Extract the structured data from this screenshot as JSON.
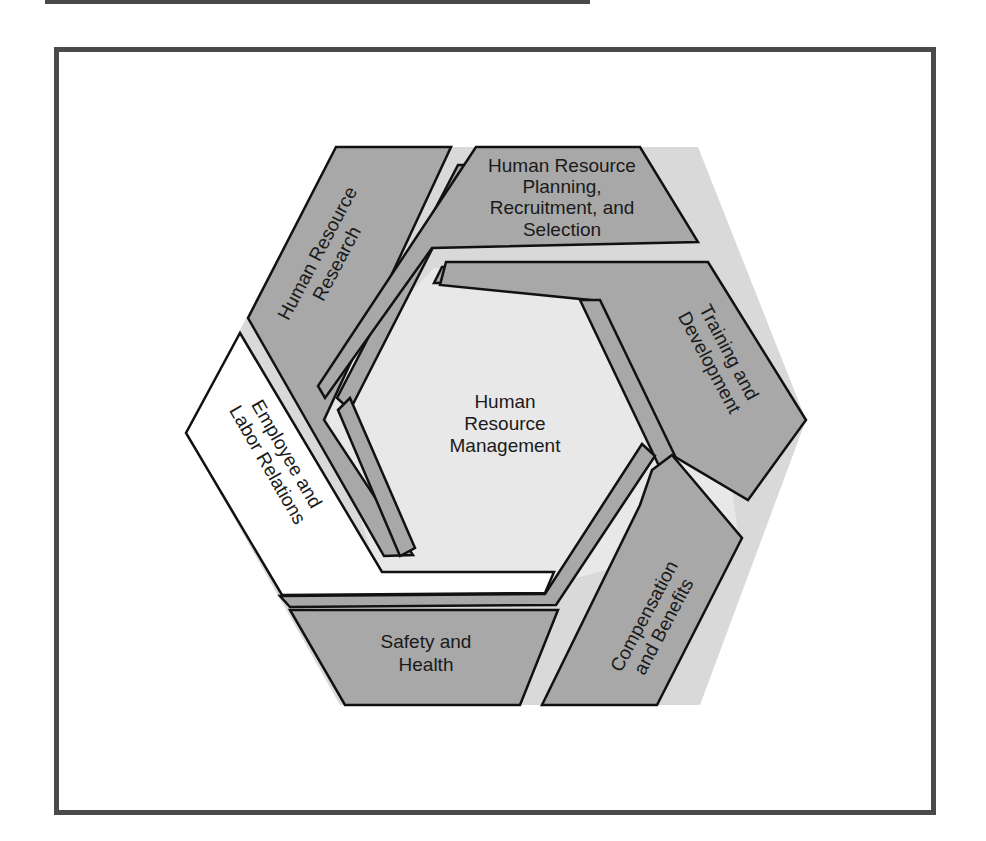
{
  "diagram": {
    "center": {
      "label_lines": [
        "Human",
        "Resource",
        "Management"
      ]
    },
    "segments": [
      {
        "id": "hr-research",
        "label_lines": [
          "Human Resource",
          "Research"
        ],
        "fill": "#a8a8a8"
      },
      {
        "id": "hr-planning",
        "label_lines": [
          "Human Resource",
          "Planning,",
          "Recruitment, and",
          "Selection"
        ],
        "fill": "#a8a8a8"
      },
      {
        "id": "training",
        "label_lines": [
          "Training and",
          "Development"
        ],
        "fill": "#a8a8a8"
      },
      {
        "id": "compensation",
        "label_lines": [
          "Compensation",
          "and Benefits"
        ],
        "fill": "#a8a8a8"
      },
      {
        "id": "safety",
        "label_lines": [
          "Safety and",
          "Health"
        ],
        "fill": "#a8a8a8"
      },
      {
        "id": "employee-relations",
        "label_lines": [
          "Employee and",
          "Labor Relations"
        ],
        "fill": "#ffffff"
      }
    ],
    "colors": {
      "segment_fill": "#a8a8a8",
      "gap_fill": "#d8d8d8",
      "center_fill": "#e4e4e4",
      "outline": "#111111",
      "frame": "#4a4a4a"
    }
  }
}
